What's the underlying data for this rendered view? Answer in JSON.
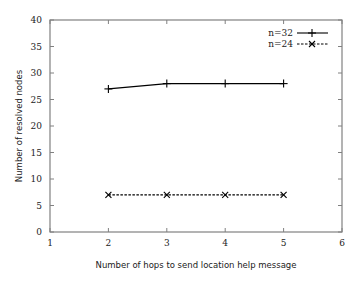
{
  "chart_data": {
    "type": "line",
    "title": "",
    "xlabel": "Number of hops to send location help message",
    "ylabel": "Number of resolved nodes",
    "xlim": [
      1,
      6
    ],
    "ylim": [
      0,
      40
    ],
    "xticks": [
      1,
      2,
      3,
      4,
      5,
      6
    ],
    "yticks": [
      0,
      5,
      10,
      15,
      20,
      25,
      30,
      35,
      40
    ],
    "grid": false,
    "legend_position": "top-right",
    "x": [
      2,
      3,
      4,
      5
    ],
    "series": [
      {
        "name": "n=32",
        "values": [
          27,
          28,
          28,
          28
        ],
        "line_style": "solid",
        "marker": "plus",
        "color": "#000000"
      },
      {
        "name": "n=24",
        "values": [
          7,
          7,
          7,
          7
        ],
        "line_style": "dashed",
        "marker": "x",
        "color": "#000000"
      }
    ]
  },
  "colors": {
    "axis": "#808080",
    "line": "#000000"
  }
}
